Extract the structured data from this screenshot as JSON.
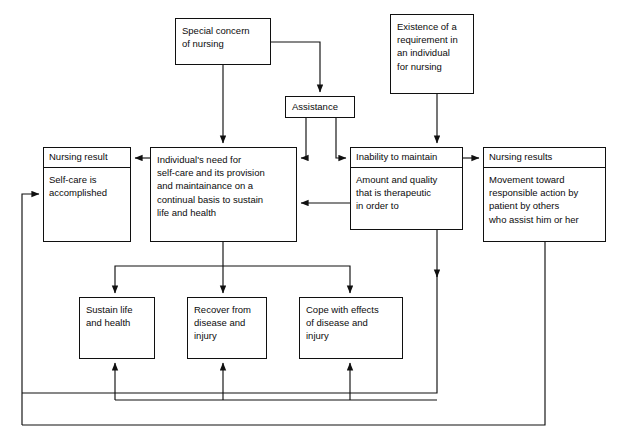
{
  "diagram": {
    "type": "flowchart",
    "title_visible": false,
    "line_color": "#101010",
    "background": "#ffffff",
    "nodes": [
      {
        "id": "special-concern",
        "label": "Special concern of nursing",
        "lines": [
          "Special concern",
          "of nursing"
        ],
        "x": 175,
        "y": 18,
        "w": 96,
        "h": 47
      },
      {
        "id": "existence-requirement",
        "label": "Existence of a requirement in an individual for nursing",
        "lines": [
          "Existence of a",
          "requirement in",
          "an individual",
          "for nursing"
        ],
        "x": 390,
        "y": 14,
        "w": 84,
        "h": 80
      },
      {
        "id": "assistance",
        "label": "Assistance",
        "lines": [
          "Assistance"
        ],
        "x": 285,
        "y": 96,
        "w": 70,
        "h": 22
      },
      {
        "id": "nursing-result-left",
        "header": "Nursing result",
        "lines": [
          "Self-care is",
          "accomplished"
        ],
        "x": 43,
        "y": 147,
        "w": 88,
        "h": 95
      },
      {
        "id": "individual-need",
        "label": "Individual's need for self-care and its provision and maintainance on a continual basis to sustain life and health",
        "lines": [
          "Individual's need for",
          "self-care and its provision",
          "and maintainance on a",
          "continual basis to sustain",
          "life and health"
        ],
        "x": 150,
        "y": 147,
        "w": 147,
        "h": 95
      },
      {
        "id": "inability-maintain",
        "header": "Inability to maintain",
        "lines": [
          "Amount and quality",
          "that is therapeutic",
          "in order to"
        ],
        "x": 350,
        "y": 147,
        "w": 113,
        "h": 83
      },
      {
        "id": "nursing-results-right",
        "header": "Nursing results",
        "lines": [
          "Movement toward",
          "responsible action by",
          "patient by others",
          "who assist him or her"
        ],
        "x": 483,
        "y": 147,
        "w": 123,
        "h": 95
      },
      {
        "id": "sustain-life",
        "label": "Sustain life and health",
        "lines": [
          "Sustain life",
          "and health"
        ],
        "x": 79,
        "y": 297,
        "w": 76,
        "h": 62
      },
      {
        "id": "recover-disease",
        "label": "Recover from disease and injury",
        "lines": [
          "Recover from",
          "disease and",
          "injury"
        ],
        "x": 187,
        "y": 297,
        "w": 80,
        "h": 62
      },
      {
        "id": "cope-effects",
        "label": "Cope with effects of disease and injury",
        "lines": [
          "Cope with effects",
          "of disease and",
          "injury"
        ],
        "x": 299,
        "y": 297,
        "w": 104,
        "h": 62
      }
    ],
    "edges": [
      {
        "from": "special-concern",
        "to": "individual-need",
        "kind": "down-arrow"
      },
      {
        "from": "special-concern",
        "to": "assistance",
        "kind": "right-down-arrow"
      },
      {
        "from": "existence-requirement",
        "to": "inability-maintain",
        "kind": "down-arrow"
      },
      {
        "from": "assistance",
        "to": "individual-need",
        "kind": "down-left-arrow"
      },
      {
        "from": "assistance",
        "to": "inability-maintain",
        "kind": "down-right-arrow"
      },
      {
        "from": "individual-need",
        "to": "nursing-result-left",
        "kind": "left-arrow"
      },
      {
        "from": "inability-maintain",
        "to": "nursing-results-right",
        "kind": "right-arrow"
      },
      {
        "from": "inability-maintain",
        "to": "individual-need",
        "kind": "left-arrow"
      },
      {
        "from": "individual-need",
        "to": "sustain-life",
        "kind": "down-split-arrow"
      },
      {
        "from": "individual-need",
        "to": "recover-disease",
        "kind": "down-arrow"
      },
      {
        "from": "individual-need",
        "to": "cope-effects",
        "kind": "down-split-arrow"
      },
      {
        "from": "inability-maintain",
        "to": "bottom-bus",
        "kind": "down-arrow"
      },
      {
        "from": "sustain-life",
        "to": "return-bus",
        "kind": "up-arrow"
      },
      {
        "from": "recover-disease",
        "to": "return-bus",
        "kind": "up-arrow"
      },
      {
        "from": "cope-effects",
        "to": "return-bus",
        "kind": "up-arrow"
      },
      {
        "from": "nursing-results-right",
        "to": "nursing-result-left",
        "kind": "outer-loop-arrow"
      }
    ]
  }
}
